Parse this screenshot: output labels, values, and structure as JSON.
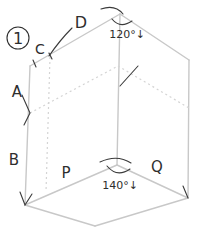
{
  "diagram": {
    "figure_number": "1",
    "labels": {
      "A": "A",
      "B": "B",
      "C": "C",
      "D": "D",
      "P": "P",
      "Q": "Q"
    },
    "angles": {
      "top": "120°↓",
      "bottom": "140°↓"
    },
    "colors": {
      "edge": "#c8c8c8",
      "annotation": "#2e2e2e"
    }
  }
}
